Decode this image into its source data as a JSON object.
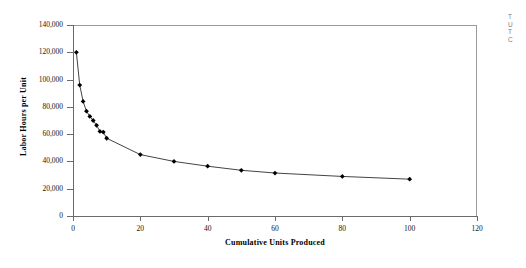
{
  "chart_data": {
    "type": "line",
    "title": "",
    "xlabel": "Cumulative Units Produced",
    "ylabel": "Labor Hours per Unit",
    "xlim": [
      0,
      120
    ],
    "ylim": [
      0,
      140000
    ],
    "xticks": [
      0,
      20,
      40,
      60,
      80,
      100,
      120
    ],
    "xtick_labels": [
      "0",
      "20",
      "40",
      "60",
      "80",
      "100",
      "120"
    ],
    "yticks": [
      0,
      20000,
      40000,
      60000,
      80000,
      100000,
      120000,
      140000
    ],
    "ytick_labels": [
      "0",
      "20,000",
      "40,000",
      "60,000",
      "80,000",
      "100,000",
      "120,000",
      "140,000"
    ],
    "grid": false,
    "legend": false,
    "marker": "diamond",
    "marker_color": "#000000",
    "line_color": "#444444",
    "series": [
      {
        "name": "Labor Hours per Unit",
        "x": [
          1,
          2,
          3,
          4,
          5,
          6,
          7,
          8,
          9,
          10,
          20,
          30,
          40,
          50,
          60,
          80,
          100
        ],
        "values": [
          120000,
          96000,
          84000,
          76800,
          73000,
          70000,
          66500,
          62000,
          61500,
          57000,
          45000,
          40000,
          36500,
          33500,
          31500,
          29000,
          27000
        ]
      }
    ]
  },
  "axis": {
    "x_title": "Cumulative Units Produced",
    "y_title": "Labor Hours per Unit"
  },
  "side_note": {
    "line1": "T",
    "line2": "U",
    "line3": "T",
    "line4": "C"
  }
}
